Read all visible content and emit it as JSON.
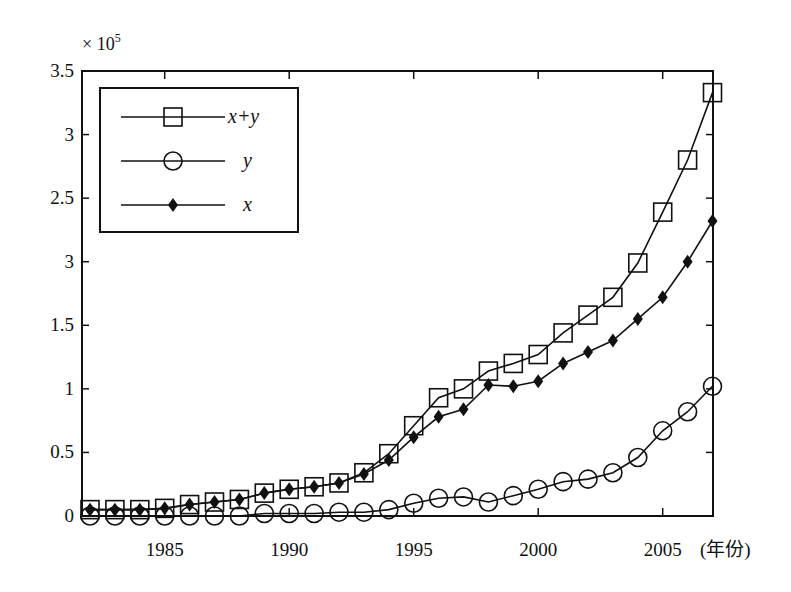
{
  "chart_data": {
    "type": "line",
    "title": "",
    "xlabel": "(年份)",
    "ylabel": "",
    "y_multiplier": "× 10",
    "y_multiplier_exp": "5",
    "xlim": [
      1981.7,
      2007
    ],
    "ylim": [
      0,
      3.5
    ],
    "grid": false,
    "legend_position": "upper left (boxed)",
    "x": [
      1982,
      1983,
      1984,
      1985,
      1986,
      1987,
      1988,
      1989,
      1990,
      1991,
      1992,
      1993,
      1994,
      1995,
      1996,
      1997,
      1998,
      1999,
      2000,
      2001,
      2002,
      2003,
      2004,
      2005,
      2006,
      2007
    ],
    "x_ticks": [
      1985,
      1990,
      1995,
      2000,
      2005
    ],
    "x_tick_labels": [
      "1985",
      "1990",
      "1995",
      "2000",
      "2005"
    ],
    "y_ticks": [
      0,
      0.5,
      1,
      1.5,
      2,
      2.5,
      3,
      3.5
    ],
    "y_tick_labels": [
      "0",
      "0.5",
      "1",
      "1.5",
      "3",
      "2.5",
      "3",
      "3.5"
    ],
    "series": [
      {
        "name": "x+y",
        "marker": "square-open",
        "values": [
          0.05,
          0.05,
          0.05,
          0.06,
          0.09,
          0.11,
          0.13,
          0.18,
          0.21,
          0.23,
          0.26,
          0.34,
          0.49,
          0.71,
          0.93,
          1.0,
          1.14,
          1.2,
          1.27,
          1.44,
          1.58,
          1.72,
          1.99,
          2.39,
          2.8,
          3.33
        ]
      },
      {
        "name": "y",
        "marker": "circle-open",
        "values": [
          0.0,
          0.0,
          0.0,
          0.0,
          0.0,
          0.0,
          0.0,
          0.02,
          0.02,
          0.02,
          0.03,
          0.03,
          0.05,
          0.1,
          0.14,
          0.15,
          0.11,
          0.16,
          0.21,
          0.27,
          0.29,
          0.34,
          0.46,
          0.67,
          0.82,
          1.02
        ]
      },
      {
        "name": "x",
        "marker": "diamond-filled",
        "values": [
          0.05,
          0.05,
          0.05,
          0.06,
          0.09,
          0.11,
          0.13,
          0.18,
          0.21,
          0.23,
          0.26,
          0.33,
          0.44,
          0.62,
          0.78,
          0.84,
          1.03,
          1.02,
          1.06,
          1.2,
          1.29,
          1.38,
          1.55,
          1.72,
          2.0,
          2.32
        ]
      }
    ],
    "legend": [
      {
        "label": "x+y",
        "marker": "square-open"
      },
      {
        "label": "y",
        "marker": "circle-open"
      },
      {
        "label": "x",
        "marker": "diamond-filled"
      }
    ]
  },
  "colors": {
    "line": "#111111",
    "background": "#ffffff"
  }
}
